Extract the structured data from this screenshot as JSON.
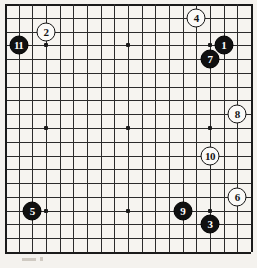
{
  "diagram": {
    "type": "go-board",
    "board_size": 19,
    "title": "",
    "background_color": "#f4f2ee",
    "line_color": "#2b2b2b",
    "black_stone_color": "#101010",
    "white_stone_color": "#fbfaf8",
    "star_points": [
      {
        "col": 4,
        "row": 4
      },
      {
        "col": 10,
        "row": 4
      },
      {
        "col": 16,
        "row": 4
      },
      {
        "col": 4,
        "row": 10
      },
      {
        "col": 10,
        "row": 10
      },
      {
        "col": 16,
        "row": 10
      },
      {
        "col": 4,
        "row": 16
      },
      {
        "col": 10,
        "row": 16
      },
      {
        "col": 16,
        "row": 16
      }
    ],
    "stones": [
      {
        "number": "1",
        "color": "black",
        "col": 17,
        "row": 4
      },
      {
        "number": "2",
        "color": "white",
        "col": 4,
        "row": 3
      },
      {
        "number": "3",
        "color": "black",
        "col": 16,
        "row": 17
      },
      {
        "number": "4",
        "color": "white",
        "col": 15,
        "row": 2
      },
      {
        "number": "5",
        "color": "black",
        "col": 3,
        "row": 16
      },
      {
        "number": "6",
        "color": "white",
        "col": 18,
        "row": 15
      },
      {
        "number": "7",
        "color": "black",
        "col": 16,
        "row": 5
      },
      {
        "number": "8",
        "color": "white",
        "col": 18,
        "row": 9
      },
      {
        "number": "9",
        "color": "black",
        "col": 14,
        "row": 16
      },
      {
        "number": "10",
        "color": "white",
        "col": 16,
        "row": 12
      },
      {
        "number": "11",
        "color": "black",
        "col": 2,
        "row": 4
      }
    ]
  }
}
